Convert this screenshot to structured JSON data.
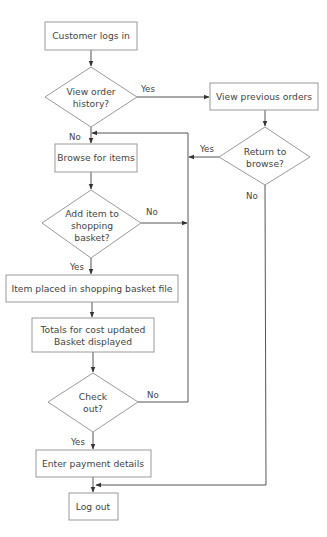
{
  "diagram": {
    "type": "flowchart",
    "colors": {
      "stroke": "#9a9a9a",
      "text": "#444444",
      "arrow": "#333333",
      "background": "#ffffff"
    },
    "nodes": {
      "customer_logs_in": {
        "kind": "process",
        "lines": [
          "Customer logs in"
        ]
      },
      "view_order_history": {
        "kind": "decision",
        "lines": [
          "View order",
          "history?"
        ]
      },
      "view_previous_orders": {
        "kind": "process",
        "lines": [
          "View previous orders"
        ]
      },
      "return_to_browse": {
        "kind": "decision",
        "lines": [
          "Return to",
          "browse?"
        ]
      },
      "browse_for_items": {
        "kind": "process",
        "lines": [
          "Browse for items"
        ]
      },
      "add_item": {
        "kind": "decision",
        "lines": [
          "Add item to",
          "shopping",
          "basket?"
        ]
      },
      "item_placed": {
        "kind": "process",
        "lines": [
          "Item placed in shopping basket file"
        ]
      },
      "totals_updated": {
        "kind": "process",
        "lines": [
          "Totals for cost updated",
          "Basket displayed"
        ]
      },
      "check_out": {
        "kind": "decision",
        "lines": [
          "Check",
          "out?"
        ]
      },
      "enter_payment": {
        "kind": "process",
        "lines": [
          "Enter payment details"
        ]
      },
      "log_out": {
        "kind": "process",
        "lines": [
          "Log out"
        ]
      }
    },
    "edge_labels": {
      "view_history_yes": "Yes",
      "view_history_no": "No",
      "return_browse_yes": "Yes",
      "return_browse_no": "No",
      "add_item_no": "No",
      "add_item_yes": "Yes",
      "check_out_no": "No",
      "check_out_yes": "Yes"
    },
    "edges": [
      {
        "from": "customer_logs_in",
        "to": "view_order_history"
      },
      {
        "from": "view_order_history",
        "to": "view_previous_orders",
        "label": "Yes"
      },
      {
        "from": "view_order_history",
        "to": "browse_for_items",
        "label": "No"
      },
      {
        "from": "view_previous_orders",
        "to": "return_to_browse"
      },
      {
        "from": "return_to_browse",
        "to": "browse_for_items",
        "label": "Yes"
      },
      {
        "from": "return_to_browse",
        "to": "log_out",
        "label": "No"
      },
      {
        "from": "browse_for_items",
        "to": "add_item"
      },
      {
        "from": "add_item",
        "to": "browse_for_items",
        "label": "No"
      },
      {
        "from": "add_item",
        "to": "item_placed",
        "label": "Yes"
      },
      {
        "from": "item_placed",
        "to": "totals_updated"
      },
      {
        "from": "totals_updated",
        "to": "check_out"
      },
      {
        "from": "check_out",
        "to": "browse_for_items",
        "label": "No"
      },
      {
        "from": "check_out",
        "to": "enter_payment",
        "label": "Yes"
      },
      {
        "from": "enter_payment",
        "to": "log_out"
      }
    ]
  }
}
